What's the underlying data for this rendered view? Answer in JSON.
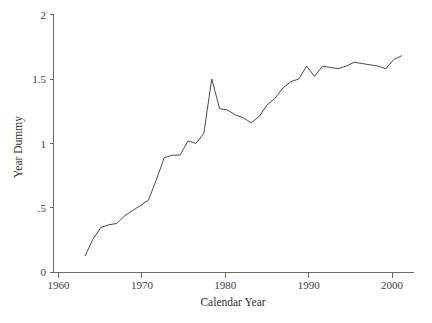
{
  "chart_data": {
    "type": "line",
    "title": "",
    "xlabel": "Calendar Year",
    "ylabel": "Year Dummy",
    "xlim": [
      1960,
      2005.5
    ],
    "ylim": [
      0,
      2
    ],
    "grid": false,
    "legend": "none",
    "xticks": [
      1960,
      1970,
      1980,
      1990,
      2000
    ],
    "xticklabels": [
      "1960",
      "1970",
      "1980",
      "1990",
      "2000"
    ],
    "yticks": [
      0,
      0.5,
      1,
      1.5,
      2
    ],
    "yticklabels": [
      "0",
      ".5",
      "1",
      "1.5",
      "2"
    ],
    "series": [
      {
        "name": "Year Dummy",
        "x": [
          1964,
          1965,
          1966,
          1967,
          1968,
          1969,
          1970,
          1971,
          1972,
          1973,
          1974,
          1975,
          1976,
          1977,
          1978,
          1979,
          1980,
          1981,
          1982,
          1983,
          1984,
          1985,
          1986,
          1987,
          1988,
          1989,
          1990,
          1991,
          1992,
          1993,
          1994,
          1995,
          1996,
          1997,
          1998,
          1999,
          2000,
          2001,
          2002,
          2003,
          2004
        ],
        "values": [
          0.13,
          0.26,
          0.35,
          0.37,
          0.38,
          0.44,
          0.48,
          0.52,
          0.56,
          0.72,
          0.89,
          0.91,
          0.91,
          1.02,
          1.0,
          1.08,
          1.5,
          1.27,
          1.26,
          1.22,
          1.2,
          1.16,
          1.21,
          1.3,
          1.35,
          1.43,
          1.48,
          1.5,
          1.6,
          1.52,
          1.6,
          1.59,
          1.58,
          1.6,
          1.63,
          1.62,
          1.61,
          1.6,
          1.58,
          1.65,
          1.68
        ]
      }
    ]
  },
  "axes": {
    "x_title": "Calendar Year",
    "y_title": "Year Dummy"
  }
}
